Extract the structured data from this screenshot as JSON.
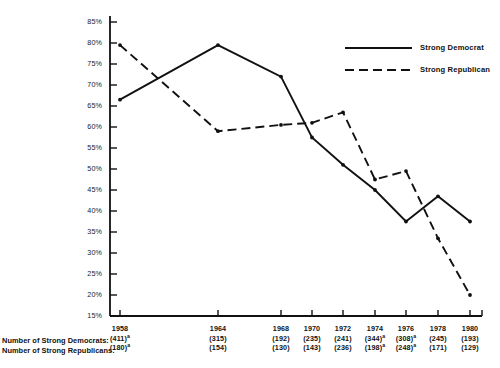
{
  "chart_data": {
    "type": "line",
    "title": "",
    "xlabel": "",
    "ylabel": "",
    "grid": false,
    "legend_position": "top-right",
    "x": [
      1958,
      1964,
      1968,
      1970,
      1972,
      1974,
      1976,
      1978,
      1980
    ],
    "categories": [
      "1958",
      "1964",
      "1968",
      "1970",
      "1972",
      "1974",
      "1976",
      "1978",
      "1980"
    ],
    "ylim": [
      15,
      85
    ],
    "ytick_labels": [
      "85%",
      "80%",
      "75%",
      "70%",
      "65%",
      "60%",
      "55%",
      "50%",
      "45%",
      "40%",
      "35%",
      "30%",
      "25%",
      "20%",
      "15%"
    ],
    "ytick_values": [
      85,
      80,
      75,
      70,
      65,
      60,
      55,
      50,
      45,
      40,
      35,
      30,
      25,
      20,
      15
    ],
    "series": [
      {
        "name": "Strong Democrat",
        "style": "solid",
        "color": "#111111",
        "values": [
          66.5,
          79.5,
          72.0,
          57.5,
          51.0,
          45.0,
          37.5,
          43.5,
          37.5
        ]
      },
      {
        "name": "Strong Republican",
        "style": "dashed",
        "color": "#111111",
        "values": [
          79.5,
          59.0,
          60.5,
          61.0,
          63.5,
          47.5,
          49.5,
          33.5,
          20.0
        ]
      }
    ],
    "footer_rows": [
      {
        "label": "Number of Strong Democrats:",
        "values": [
          "(411)",
          "(315)",
          "(192)",
          "(235)",
          "(241)",
          "(344)",
          "(308)",
          "(245)",
          "(193)"
        ],
        "superscripts": [
          "a",
          "",
          "",
          "",
          "",
          "a",
          "a",
          "",
          ""
        ]
      },
      {
        "label": "Number of Strong Republicans:",
        "values": [
          "(180)",
          "(154)",
          "(130)",
          "(143)",
          "(236)",
          "(198)",
          "(248)",
          "(171)",
          "(129)"
        ],
        "superscripts": [
          "a",
          "",
          "",
          "",
          "",
          "a",
          "a",
          "",
          ""
        ]
      }
    ]
  },
  "legend": {
    "items": [
      {
        "label": "Strong Democrat",
        "style": "solid"
      },
      {
        "label": "Strong Republican",
        "style": "dashed"
      }
    ]
  }
}
